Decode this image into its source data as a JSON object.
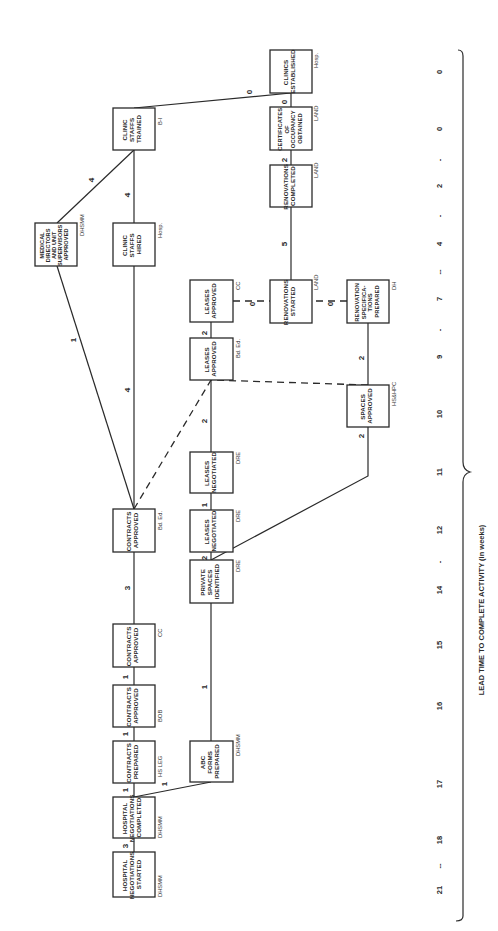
{
  "diagram": {
    "orientation": "rotated-90-ccw",
    "axis": {
      "title": "LEAD TIME TO COMPLETE ACTIVITY (in weeks)",
      "ticks": [
        "21",
        "--",
        "18",
        "17",
        "16",
        "15",
        "14",
        "-",
        "12",
        "11",
        "10",
        "9",
        "-",
        "7",
        "--",
        "4",
        "-",
        "2",
        "-",
        "0",
        "0"
      ]
    },
    "nodes": [
      {
        "id": "n1",
        "lines": [
          "HOSPITAL",
          "NEGOTIATIONS",
          "STARTED"
        ],
        "agency": "DHSMM"
      },
      {
        "id": "n2",
        "lines": [
          "HOSPITAL",
          "NEGOTIATIONS",
          "COMPLETED"
        ],
        "agency": "DHSMM"
      },
      {
        "id": "n3",
        "lines": [
          "CONTRACTS",
          "PREPARED"
        ],
        "agency": "HS LEG"
      },
      {
        "id": "n4",
        "lines": [
          "CONTRACTS",
          "APPROVED"
        ],
        "agency": "BOB"
      },
      {
        "id": "n5",
        "lines": [
          "CONTRACTS",
          "APPROVED"
        ],
        "agency": "CC"
      },
      {
        "id": "n6",
        "lines": [
          "CONTRACTS",
          "APPROVED"
        ],
        "agency": "Bd. Ed."
      },
      {
        "id": "n7",
        "lines": [
          "MEDICAL",
          "DIRECTORS",
          "AND UNIT",
          "SUPERVISORS",
          "APPROVED"
        ],
        "agency": "DHSMM"
      },
      {
        "id": "n8",
        "lines": [
          "CLINIC",
          "STAFFS",
          "HIRED"
        ],
        "agency": "Hosp."
      },
      {
        "id": "n9",
        "lines": [
          "CLINIC",
          "STAFFS",
          "TRAINED"
        ],
        "agency": "B-I"
      },
      {
        "id": "n10",
        "lines": [
          "ABC",
          "FORMS",
          "PREPARED"
        ],
        "agency": "DHSMM"
      },
      {
        "id": "n11",
        "lines": [
          "PRIVATE",
          "SPACES",
          "IDENTIFIED"
        ],
        "agency": "DRE"
      },
      {
        "id": "n12",
        "lines": [
          "LEASES",
          "NEGOTIATED"
        ],
        "agency": "DRE"
      },
      {
        "id": "n13",
        "lines": [
          "LEASES",
          "NEGOTIATED"
        ],
        "agency": "DRE"
      },
      {
        "id": "n14",
        "lines": [
          "LEASES",
          "APPROVED"
        ],
        "agency": "Bd. Ed."
      },
      {
        "id": "n15",
        "lines": [
          "LEASES",
          "APPROVED"
        ],
        "agency": "CC"
      },
      {
        "id": "n16",
        "lines": [
          "RENOVATIONS",
          "STARTED"
        ],
        "agency": "LAND"
      },
      {
        "id": "n17",
        "lines": [
          "RENOVATIONS",
          "COMPLETED"
        ],
        "agency": "LAND"
      },
      {
        "id": "n18",
        "lines": [
          "CERTIFICATES",
          "OF",
          "OCCUPANCY",
          "OBTAINED"
        ],
        "agency": "LAND"
      },
      {
        "id": "n19",
        "lines": [
          "CLINICS",
          "ESTABLISHED"
        ],
        "agency": "Hosp."
      },
      {
        "id": "n20",
        "lines": [
          "SPACES",
          "APPROVED"
        ],
        "agency": "HS&HPC"
      },
      {
        "id": "n21",
        "lines": [
          "RENOVATION",
          "SPECIFICA-",
          "TIONS",
          "PREPARED"
        ],
        "agency": "DH"
      }
    ],
    "edges": [
      {
        "from": "n1",
        "to": "n2",
        "duration": "3",
        "style": "solid"
      },
      {
        "from": "n2",
        "to": "n3",
        "duration": "1",
        "style": "solid"
      },
      {
        "from": "n2",
        "to": "n10",
        "duration": "1",
        "style": "solid"
      },
      {
        "from": "n3",
        "to": "n4",
        "duration": "1",
        "style": "solid"
      },
      {
        "from": "n4",
        "to": "n5",
        "duration": "1",
        "style": "solid"
      },
      {
        "from": "n5",
        "to": "n6",
        "duration": "3",
        "style": "solid"
      },
      {
        "from": "n6",
        "to": "n7",
        "duration": "1",
        "style": "solid"
      },
      {
        "from": "n6",
        "to": "n8",
        "duration": "4",
        "style": "solid"
      },
      {
        "from": "n6",
        "to": "n14",
        "duration": "0",
        "style": "dashed"
      },
      {
        "from": "n7",
        "to": "n9",
        "duration": "4",
        "style": "solid"
      },
      {
        "from": "n8",
        "to": "n9",
        "duration": "4",
        "style": "solid"
      },
      {
        "from": "n9",
        "to": "n19",
        "duration": "0",
        "style": "solid"
      },
      {
        "from": "n10",
        "to": "n11",
        "duration": "1",
        "style": "solid"
      },
      {
        "from": "n11",
        "to": "n12",
        "duration": "2",
        "style": "solid"
      },
      {
        "from": "n11",
        "to": "n20",
        "duration": "2",
        "style": "solid"
      },
      {
        "from": "n12",
        "to": "n13",
        "duration": "1",
        "style": "solid"
      },
      {
        "from": "n13",
        "to": "n14",
        "duration": "2",
        "style": "solid"
      },
      {
        "from": "n14",
        "to": "n15",
        "duration": "2",
        "style": "solid"
      },
      {
        "from": "n20",
        "to": "n14",
        "duration": "0",
        "style": "dashed"
      },
      {
        "from": "n15",
        "to": "n16",
        "duration": "0",
        "style": "dashed"
      },
      {
        "from": "n21",
        "to": "n16",
        "duration": "0",
        "style": "dashed"
      },
      {
        "from": "n20",
        "to": "n21",
        "duration": "2",
        "style": "solid"
      },
      {
        "from": "n16",
        "to": "n17",
        "duration": "5",
        "style": "solid"
      },
      {
        "from": "n17",
        "to": "n18",
        "duration": "2",
        "style": "solid"
      },
      {
        "from": "n18",
        "to": "n19",
        "duration": "0",
        "style": "solid"
      }
    ]
  }
}
